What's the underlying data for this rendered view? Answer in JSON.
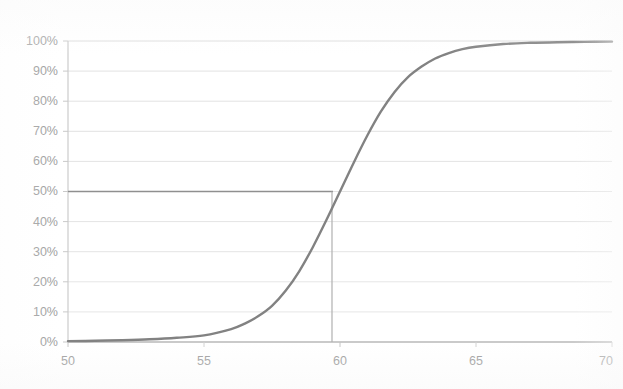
{
  "chart": {
    "title": "",
    "background_color": "#ffffff",
    "curve_color": "#828282",
    "gridline_color": "#e2e2e2",
    "axis_color": "#c9c9c9",
    "reference_line_color": "#8c8c8c",
    "dropline_color": "#b5b5b5",
    "tick_label_color": "#9a9a9a"
  },
  "chart_data": {
    "type": "line",
    "title": "",
    "subtitle": "",
    "xlabel": "",
    "ylabel": "",
    "xlim": [
      50,
      70
    ],
    "ylim": [
      0,
      1
    ],
    "grid": true,
    "legend": "none",
    "x_ticks": [
      50,
      55,
      60,
      65,
      70
    ],
    "x_tick_labels": [
      "50",
      "55",
      "60",
      "65",
      "70"
    ],
    "y_ticks": [
      0,
      0.1,
      0.2,
      0.3,
      0.4,
      0.5,
      0.6,
      0.7,
      0.8,
      0.9,
      1.0
    ],
    "y_tick_labels": [
      "0%",
      "10%",
      "20%",
      "30%",
      "40%",
      "50%",
      "60%",
      "70%",
      "80%",
      "90%",
      "100%"
    ],
    "series": [
      {
        "name": "cumulative probability",
        "kind": "logistic-s-curve",
        "x": [
          50,
          51,
          52,
          53,
          54,
          55,
          56,
          56.5,
          57,
          57.5,
          58,
          58.5,
          59,
          59.5,
          60,
          60.5,
          61,
          61.5,
          62,
          62.5,
          63,
          63.5,
          64,
          64.5,
          65,
          66,
          67,
          68,
          69,
          70
        ],
        "values": [
          0.003,
          0.004,
          0.006,
          0.009,
          0.014,
          0.022,
          0.043,
          0.061,
          0.086,
          0.12,
          0.17,
          0.235,
          0.315,
          0.405,
          0.5,
          0.595,
          0.685,
          0.765,
          0.83,
          0.88,
          0.915,
          0.942,
          0.96,
          0.973,
          0.981,
          0.99,
          0.994,
          0.996,
          0.997,
          0.998
        ]
      }
    ],
    "annotations": [
      {
        "name": "median-reference-line-horizontal",
        "kind": "horizontal-line",
        "y": 0.5,
        "x_from": 50,
        "x_to": 60,
        "label": "50%"
      },
      {
        "name": "median-dropline-vertical",
        "kind": "vertical-line",
        "x": 60,
        "y_from": 0,
        "y_to": 0.5,
        "label": "60"
      }
    ]
  }
}
